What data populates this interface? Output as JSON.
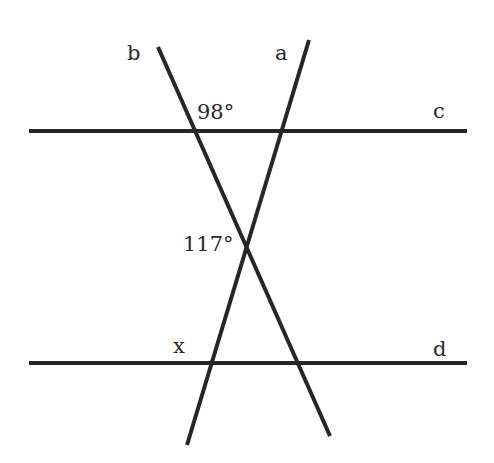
{
  "diagram": {
    "type": "geometry-parallel-lines-transversals",
    "lines": [
      {
        "id": "c",
        "label": "c",
        "kind": "parallel-line"
      },
      {
        "id": "d",
        "label": "d",
        "kind": "parallel-line"
      },
      {
        "id": "a",
        "label": "a",
        "kind": "transversal"
      },
      {
        "id": "b",
        "label": "b",
        "kind": "transversal"
      }
    ],
    "angles": [
      {
        "label": "98°",
        "at": "intersection of b and c",
        "value_deg": 98
      },
      {
        "label": "117°",
        "at": "intersection of a and b",
        "value_deg": 117
      },
      {
        "label": "x",
        "at": "intersection of a and d",
        "value_deg": null
      }
    ]
  },
  "colors": {
    "line": "#262626",
    "text": "#2a2a2a",
    "background": "#ffffff"
  }
}
